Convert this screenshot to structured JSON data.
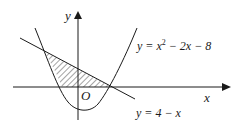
{
  "diagram": {
    "axes": {
      "x_label": "x",
      "y_label": "y",
      "origin_label": "O"
    },
    "curves": {
      "parabola": {
        "equation_prefix": "y = x",
        "equation_exponent": "2",
        "equation_suffix": " − 2x − 8",
        "full": "y = x^2 − 2x − 8"
      },
      "line": {
        "equation": "y = 4 − x"
      }
    },
    "shaded_region": {
      "description": "Region bounded by line y = 4 − x, parabola y = x^2 − 2x − 8, and the x-axis",
      "fill": "hatched"
    },
    "colors": {
      "stroke": "#1a1a1a",
      "background": "#ffffff"
    }
  }
}
